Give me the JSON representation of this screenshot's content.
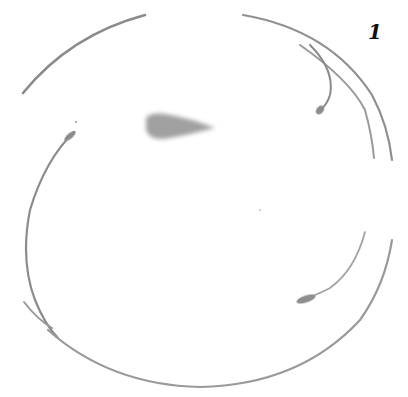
{
  "figure": {
    "panel_label": "1",
    "colors": {
      "background": "#ffffff",
      "stroke": "#8a8a8a",
      "stroke_light": "#b0b0b0",
      "blob": "#9c9c9c",
      "label": "#111111"
    }
  }
}
